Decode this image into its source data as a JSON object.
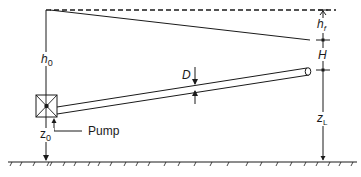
{
  "diagram": {
    "type": "pump-pipeline-hydraulic-grade",
    "labels": {
      "h0": "h",
      "h0_sub": "0",
      "hf": "h",
      "hf_sub": "f",
      "H": "H",
      "D": "D",
      "zL": "z",
      "zL_sub": "L",
      "z0": "z",
      "z0_sub": "0",
      "pump": "Pump"
    },
    "colors": {
      "line": "#1a1a1a",
      "background": "#ffffff"
    }
  }
}
